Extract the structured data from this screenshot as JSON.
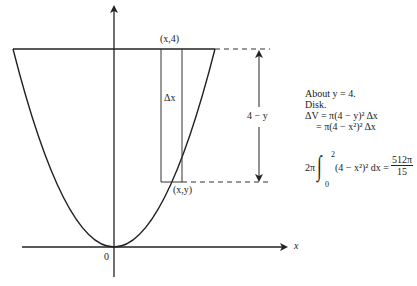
{
  "figure": {
    "type": "solid-of-revolution-diagram",
    "curve": "y = x^2",
    "axis_labels": {
      "x": "x",
      "origin": "0"
    },
    "point_labels": {
      "top": "(x,4)",
      "curve": "(x,y)"
    },
    "strip_label": "Δx",
    "radius_label": "4 − y",
    "colors": {
      "stroke": "#222222",
      "background": "#ffffff"
    }
  },
  "notes": {
    "line1": "About  y = 4.",
    "line2": "Disk.",
    "line3": "ΔV = π(4 − y)² Δx",
    "line4": "= π(4 − x²)² Δx"
  },
  "integral": {
    "coef": "2π",
    "upper": "2",
    "lower": "0",
    "integrand": "(4 − x²)² dx =",
    "result_num": "512π",
    "result_den": "15"
  }
}
